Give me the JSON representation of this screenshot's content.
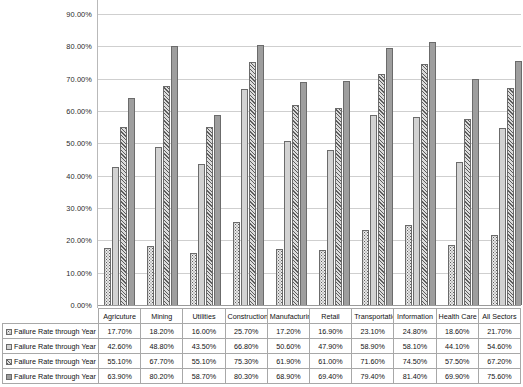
{
  "chart_data": {
    "type": "bar",
    "title": "",
    "subtitle": "",
    "xlabel": "",
    "ylabel": "",
    "ylim": [
      0,
      90
    ],
    "ytick_step": 10,
    "grid": true,
    "legend_position": "data-table",
    "ytick_labels": [
      "90.00%",
      "80.00%",
      "70.00%",
      "60.00%",
      "50.00%",
      "40.00%",
      "30.00%",
      "20.00%",
      "10.00%",
      "0.00%"
    ],
    "categories": [
      "Agricuture",
      "Mining",
      "Utilities",
      "Construction",
      "Manufacturing",
      "Retail",
      "Transportation",
      "Information",
      "Health Care",
      "All Sectors"
    ],
    "series": [
      {
        "name": "Failure Rate through Year 1",
        "pattern": "dotted",
        "values": [
          17.7,
          18.2,
          16.0,
          25.7,
          17.2,
          16.9,
          23.1,
          24.8,
          18.6,
          21.7
        ],
        "labels": [
          "17.70%",
          "18.20%",
          "16.00%",
          "25.70%",
          "17.20%",
          "16.90%",
          "23.10%",
          "24.80%",
          "18.60%",
          "21.70%"
        ]
      },
      {
        "name": "Failure Rate through Year 5",
        "pattern": "solid-light",
        "values": [
          42.6,
          48.8,
          43.5,
          66.8,
          50.6,
          47.9,
          58.9,
          58.1,
          44.1,
          54.6
        ],
        "labels": [
          "42.60%",
          "48.80%",
          "43.50%",
          "66.80%",
          "50.60%",
          "47.90%",
          "58.90%",
          "58.10%",
          "44.10%",
          "54.60%"
        ]
      },
      {
        "name": "Failure Rate through Year 10",
        "pattern": "diagonal-hatch",
        "values": [
          55.1,
          67.7,
          55.1,
          75.3,
          61.9,
          61.0,
          71.6,
          74.5,
          57.5,
          67.2
        ],
        "labels": [
          "55.10%",
          "67.70%",
          "55.10%",
          "75.30%",
          "61.90%",
          "61.00%",
          "71.60%",
          "74.50%",
          "57.50%",
          "67.20%"
        ]
      },
      {
        "name": "Failure Rate through Year 15",
        "pattern": "solid-medium",
        "values": [
          63.9,
          80.2,
          58.7,
          80.3,
          68.9,
          69.4,
          79.4,
          81.4,
          69.9,
          75.6
        ],
        "labels": [
          "63.90%",
          "80.20%",
          "58.70%",
          "80.30%",
          "68.90%",
          "69.40%",
          "79.40%",
          "81.40%",
          "69.90%",
          "75.60%"
        ]
      }
    ]
  },
  "colors": {
    "series_1_fill": "#e9e9e9",
    "series_2_fill": "#d2d2d2",
    "series_3_fill": "#dcdcdc",
    "series_4_fill": "#9e9e9e",
    "bar_border": "#6b6b6b",
    "gridline": "#cfcfcf",
    "axis_line": "#9a9a9a",
    "table_border": "#a8a8a8",
    "text": "#111111",
    "background": "#ffffff"
  }
}
